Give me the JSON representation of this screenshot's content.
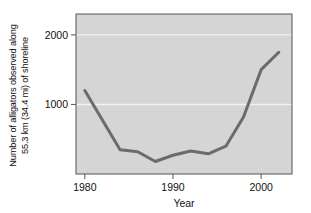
{
  "chart_data": {
    "type": "line",
    "title": "",
    "subtitle": "",
    "xlabel": "Year",
    "ylabel": "Number of alligators observed along 55.3 km (34.4 mi) of shoreline",
    "ylabel_line1": "Number of alligators observed along",
    "ylabel_line2": "55.3 km (34.4 mi) of shoreline",
    "xlim": [
      1979,
      2003.5
    ],
    "ylim": [
      0,
      2300
    ],
    "xticks": [
      1980,
      1990,
      2000
    ],
    "xtick_labels": [
      "1980",
      "1990",
      "2000"
    ],
    "yticks": [
      1000,
      2000
    ],
    "ytick_labels": [
      "1000",
      "2000"
    ],
    "grid": "horizontal-white-at-yticks",
    "legend": "none",
    "plot_background": "#d5d5d5",
    "grid_color": "#f2f2f2",
    "line_color": "#6b6b6b",
    "axis_color": "#555555",
    "text_color": "#111111",
    "line_width_px": 3,
    "x": [
      1980,
      1984,
      1986,
      1988,
      1990,
      1992,
      1994,
      1996,
      1998,
      2000,
      2002
    ],
    "values": [
      1200,
      350,
      320,
      180,
      270,
      330,
      290,
      400,
      820,
      1500,
      1750
    ],
    "series": [
      {
        "name": "Alligators observed",
        "values": [
          1200,
          350,
          320,
          180,
          270,
          330,
          290,
          400,
          820,
          1500,
          1750
        ]
      }
    ]
  }
}
